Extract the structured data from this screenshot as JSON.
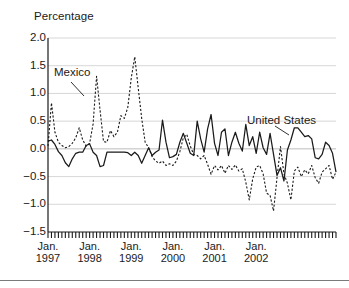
{
  "chart_data": {
    "type": "line",
    "title": "",
    "ylabel": "Percentage",
    "xlabel": "",
    "ylim": [
      -1.5,
      2.0
    ],
    "yticks": [
      "2.0",
      "1.5",
      "1.0",
      "0.5",
      "0.0",
      "−0.5",
      "−1.0",
      "−1.5"
    ],
    "ytick_values": [
      2.0,
      1.5,
      1.0,
      0.5,
      0.0,
      -0.5,
      -1.0,
      -1.5
    ],
    "grid": true,
    "grid_axis": "y",
    "legend_position": "inline-annotations",
    "x_major_labels": [
      {
        "month": "Jan.",
        "year": "1997"
      },
      {
        "month": "Jan.",
        "year": "1998"
      },
      {
        "month": "Jan.",
        "year": "1999"
      },
      {
        "month": "Jan.",
        "year": "2000"
      },
      {
        "month": "Jan.",
        "year": "2001"
      },
      {
        "month": "Jan.",
        "year": "2002"
      }
    ],
    "x_tick_interval": "monthly",
    "x_range": [
      "1997-01",
      "2002-12"
    ],
    "series": [
      {
        "name": "Mexico",
        "style": "dashed",
        "color": "#1a1a1a",
        "values": [
          0.05,
          0.83,
          0.3,
          0.12,
          0.06,
          0.02,
          0.04,
          0.1,
          0.2,
          0.38,
          0.16,
          0.05,
          0.1,
          0.45,
          1.31,
          0.7,
          0.13,
          0.12,
          0.33,
          0.22,
          0.3,
          0.6,
          0.55,
          0.75,
          1.28,
          1.66,
          1.1,
          0.55,
          0.12,
          0.02,
          -0.14,
          -0.22,
          -0.26,
          -0.22,
          -0.3,
          -0.27,
          -0.3,
          -0.22,
          -0.05,
          0.2,
          0.26,
          0.05,
          -0.1,
          -0.12,
          -0.18,
          -0.12,
          -0.28,
          -0.46,
          -0.3,
          -0.38,
          -0.3,
          -0.44,
          -0.3,
          -0.37,
          -0.29,
          -0.4,
          -0.36,
          -0.6,
          -0.92,
          -0.54,
          -0.33,
          -0.3,
          -0.45,
          -0.8,
          -0.84,
          -1.12,
          -0.52,
          0.04,
          -0.45,
          -0.62,
          -0.92,
          -0.4,
          -0.33,
          -0.5,
          -0.38,
          -0.45,
          -0.3,
          -0.52,
          -0.62,
          -0.42,
          -0.36,
          -0.3,
          -0.55,
          -0.42
        ]
      },
      {
        "name": "United States",
        "style": "solid",
        "color": "#1a1a1a",
        "values": [
          0.14,
          0.16,
          0.08,
          -0.05,
          -0.12,
          -0.25,
          -0.32,
          -0.18,
          -0.08,
          -0.06,
          -0.06,
          0.06,
          0.09,
          -0.06,
          -0.12,
          -0.32,
          -0.3,
          -0.06,
          -0.06,
          -0.06,
          -0.06,
          -0.06,
          -0.06,
          -0.07,
          -0.12,
          -0.06,
          -0.12,
          -0.26,
          -0.12,
          0.02,
          -0.12,
          -0.06,
          -0.02,
          0.52,
          0.12,
          -0.16,
          -0.14,
          -0.1,
          0.12,
          0.28,
          0.1,
          -0.08,
          -0.12,
          0.5,
          0.18,
          -0.06,
          0.36,
          0.62,
          0.1,
          -0.12,
          0.3,
          0.36,
          -0.12,
          0.12,
          0.3,
          0.1,
          -0.04,
          0.44,
          0.06,
          0.22,
          -0.08,
          0.3,
          0.02,
          -0.1,
          0.28,
          -0.1,
          -0.48,
          -0.34,
          -0.58,
          -0.02,
          0.16,
          0.38,
          0.38,
          0.3,
          0.22,
          0.24,
          0.18,
          -0.16,
          -0.18,
          -0.1,
          0.12,
          0.06,
          -0.08,
          -0.42
        ]
      }
    ],
    "annotations": [
      {
        "name": "Mexico",
        "text": "Mexico",
        "points_to": "dashed-series"
      },
      {
        "name": "United States",
        "text": "United States",
        "points_to": "solid-series"
      }
    ]
  }
}
